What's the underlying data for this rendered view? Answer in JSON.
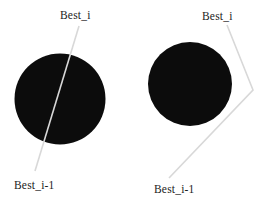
{
  "figure": {
    "left_diagram": {
      "top_label": "Best_i",
      "bottom_label": "Best_i-1"
    },
    "right_diagram": {
      "top_label": "Best_i",
      "bottom_label": "Best_i-1"
    }
  },
  "colors": {
    "disk": "#0c0c0c",
    "line": "#d8d8d8",
    "text": "#1c1c1c",
    "background": "#ffffff"
  }
}
